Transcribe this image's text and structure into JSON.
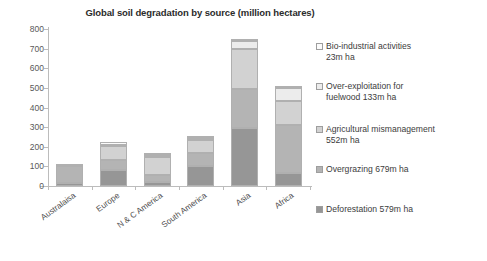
{
  "chart_data": {
    "type": "bar",
    "subtype": "stacked-bar",
    "title": "Global soil degradation by source (million hectares)",
    "xlabel": "",
    "ylabel": "",
    "ylim": [
      0,
      800
    ],
    "yticks": [
      0,
      100,
      200,
      300,
      400,
      500,
      600,
      700,
      800
    ],
    "grid": false,
    "legend_position": "right",
    "categories": [
      "Australaisa",
      "Europe",
      "N & C America",
      "South America",
      "Asia",
      "Africa"
    ],
    "series": [
      {
        "name": "Deforestation 579m ha",
        "short_name": "Deforestation",
        "total": "579m ha",
        "color": "#969696",
        "values": [
          15,
          84,
          18,
          100,
          298,
          67
        ]
      },
      {
        "name": "Overgrazing 679m ha",
        "short_name": "Overgrazing",
        "total": "679m ha",
        "color": "#b4b4b4",
        "values": [
          88,
          50,
          38,
          68,
          197,
          243
        ]
      },
      {
        "name": "Agricultural mismanagement 552m ha",
        "short_name": "Agricultural mismanagement",
        "total": "552m ha",
        "color": "#d2d2d2",
        "values": [
          2,
          70,
          91,
          68,
          204,
          121
        ]
      },
      {
        "name": "Over-exploitation for fuelwood 133m ha",
        "short_name": "Over-exploitation for fuelwood",
        "total": "133m ha",
        "color": "#ececec",
        "values": [
          0,
          3,
          11,
          9,
          41,
          67
        ]
      },
      {
        "name": "Bio-industrial activities 23m ha",
        "short_name": "Bio-industrial activities",
        "total": "23m ha",
        "color": "#fbfbfb",
        "values": [
          0,
          18,
          2,
          5,
          10,
          2
        ]
      }
    ],
    "totals": [
      105,
      225,
      160,
      250,
      750,
      500
    ]
  },
  "legend": {
    "items": [
      {
        "label": "Bio-industrial activities\n23m ha",
        "color": "#fbfbfb"
      },
      {
        "label": "Over-exploitation for\nfuelwood 133m ha",
        "color": "#ececec"
      },
      {
        "label": "Agricultural mismanagement\n552m ha",
        "color": "#d2d2d2"
      },
      {
        "label": "Overgrazing 679m ha",
        "color": "#b4b4b4"
      },
      {
        "label": "Deforestation 579m ha",
        "color": "#969696"
      }
    ]
  },
  "axis": {
    "y_tick_labels": [
      "800",
      "700",
      "600",
      "500",
      "400",
      "300",
      "200",
      "100",
      "0"
    ]
  }
}
